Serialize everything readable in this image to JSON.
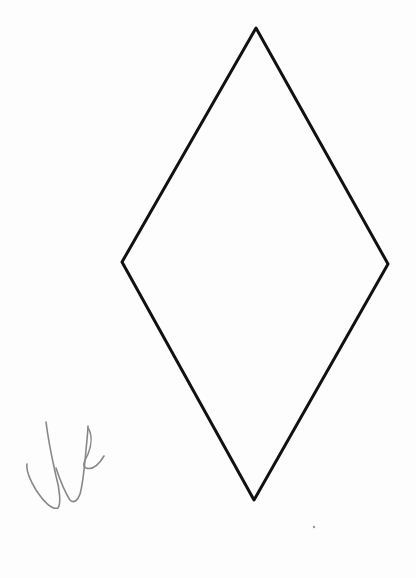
{
  "figure": {
    "width": 416,
    "height": 578,
    "background": "#fdfdfd",
    "rhombus": {
      "shape": "rhombus",
      "stroke": "#111111",
      "stroke_width": 3,
      "vertices": {
        "top": [
          256,
          28
        ],
        "right": [
          388,
          264
        ],
        "bottom": [
          254,
          500
        ],
        "left": [
          122,
          262
        ]
      }
    },
    "handwriting": {
      "description": "handwritten signature/initials scribble",
      "stroke": "#888888",
      "stroke_width": 1.6
    },
    "speck": {
      "position": [
        314,
        527
      ],
      "color": "#999999"
    }
  }
}
